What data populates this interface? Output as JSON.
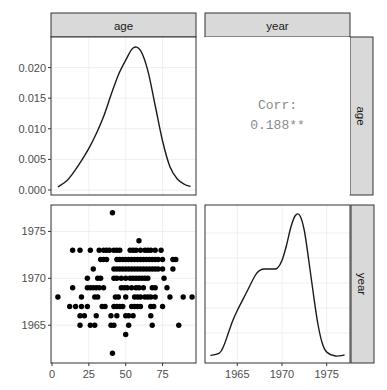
{
  "chart_data": {
    "type": "pairs",
    "title": "",
    "variables": [
      "age",
      "year"
    ],
    "panels": {
      "age_density": {
        "type": "line",
        "xlabel": "age",
        "ylabel": "density",
        "xlim": [
          0,
          97
        ],
        "ylim": [
          0,
          0.0245
        ],
        "y_ticks": [
          0.0,
          0.005,
          0.01,
          0.015,
          0.02
        ],
        "y_tick_labels": [
          "0.000",
          "0.005",
          "0.010",
          "0.015",
          "0.020"
        ],
        "x": [
          4,
          10,
          15,
          20,
          25,
          30,
          35,
          40,
          45,
          50,
          55,
          60,
          65,
          70,
          75,
          80,
          85,
          90,
          94
        ],
        "y": [
          0.0005,
          0.0015,
          0.003,
          0.0048,
          0.0068,
          0.0092,
          0.012,
          0.0155,
          0.0188,
          0.0212,
          0.0232,
          0.0228,
          0.0195,
          0.0138,
          0.008,
          0.0038,
          0.0018,
          0.0009,
          0.0006
        ]
      },
      "correlation": {
        "type": "text",
        "label": "Corr:",
        "value": "0.188**"
      },
      "scatter": {
        "type": "scatter",
        "xlabel": "age",
        "ylabel": "year",
        "xlim": [
          0,
          97
        ],
        "ylim": [
          1961.5,
          1977.5
        ],
        "x_ticks": [
          0,
          25,
          50,
          75
        ],
        "x_tick_labels": [
          "0",
          "25",
          "50",
          "75"
        ],
        "y_ticks": [
          1965,
          1970,
          1975
        ],
        "y_tick_labels": [
          "1965",
          "1970",
          "1975"
        ],
        "points": [
          [
            41,
            1977
          ],
          [
            59,
            1974
          ],
          [
            14,
            1973
          ],
          [
            19,
            1973
          ],
          [
            26,
            1973
          ],
          [
            32,
            1973
          ],
          [
            35,
            1973
          ],
          [
            37,
            1973
          ],
          [
            39,
            1973
          ],
          [
            42,
            1973
          ],
          [
            44,
            1973
          ],
          [
            46,
            1973
          ],
          [
            53,
            1973
          ],
          [
            55,
            1973
          ],
          [
            57,
            1973
          ],
          [
            60,
            1973
          ],
          [
            63,
            1973
          ],
          [
            65,
            1973
          ],
          [
            67,
            1973
          ],
          [
            70,
            1973
          ],
          [
            74,
            1973
          ],
          [
            33,
            1972
          ],
          [
            35,
            1972
          ],
          [
            37,
            1972
          ],
          [
            44,
            1972
          ],
          [
            46,
            1972
          ],
          [
            48,
            1972
          ],
          [
            50,
            1972
          ],
          [
            52,
            1972
          ],
          [
            54,
            1972
          ],
          [
            56,
            1972
          ],
          [
            58,
            1972
          ],
          [
            60,
            1972
          ],
          [
            62,
            1972
          ],
          [
            64,
            1972
          ],
          [
            66,
            1972
          ],
          [
            68,
            1972
          ],
          [
            70,
            1972
          ],
          [
            72,
            1972
          ],
          [
            75,
            1972
          ],
          [
            82,
            1972
          ],
          [
            84,
            1972
          ],
          [
            28,
            1971
          ],
          [
            42,
            1971
          ],
          [
            44,
            1971
          ],
          [
            46,
            1971
          ],
          [
            48,
            1971
          ],
          [
            50,
            1971
          ],
          [
            52,
            1971
          ],
          [
            54,
            1971
          ],
          [
            56,
            1971
          ],
          [
            58,
            1971
          ],
          [
            60,
            1971
          ],
          [
            62,
            1971
          ],
          [
            64,
            1971
          ],
          [
            66,
            1971
          ],
          [
            68,
            1971
          ],
          [
            70,
            1971
          ],
          [
            72,
            1971
          ],
          [
            75,
            1971
          ],
          [
            82,
            1971
          ],
          [
            24,
            1970
          ],
          [
            31,
            1970
          ],
          [
            33,
            1970
          ],
          [
            42,
            1970
          ],
          [
            44,
            1970
          ],
          [
            47,
            1970
          ],
          [
            50,
            1970
          ],
          [
            53,
            1970
          ],
          [
            55,
            1970
          ],
          [
            57,
            1970
          ],
          [
            59,
            1970
          ],
          [
            61,
            1970
          ],
          [
            63,
            1970
          ],
          [
            65,
            1970
          ],
          [
            76,
            1970
          ],
          [
            14,
            1969
          ],
          [
            24,
            1969
          ],
          [
            26,
            1969
          ],
          [
            28,
            1969
          ],
          [
            30,
            1969
          ],
          [
            32,
            1969
          ],
          [
            35,
            1969
          ],
          [
            47,
            1969
          ],
          [
            49,
            1969
          ],
          [
            51,
            1969
          ],
          [
            54,
            1969
          ],
          [
            57,
            1969
          ],
          [
            59,
            1969
          ],
          [
            62,
            1969
          ],
          [
            68,
            1969
          ],
          [
            70,
            1969
          ],
          [
            78,
            1969
          ],
          [
            4,
            1968
          ],
          [
            20,
            1968
          ],
          [
            29,
            1968
          ],
          [
            31,
            1968
          ],
          [
            43,
            1968
          ],
          [
            45,
            1968
          ],
          [
            50,
            1968
          ],
          [
            56,
            1968
          ],
          [
            58,
            1968
          ],
          [
            60,
            1968
          ],
          [
            63,
            1968
          ],
          [
            65,
            1968
          ],
          [
            67,
            1968
          ],
          [
            70,
            1968
          ],
          [
            80,
            1968
          ],
          [
            89,
            1968
          ],
          [
            95,
            1968
          ],
          [
            12,
            1967
          ],
          [
            16,
            1967
          ],
          [
            20,
            1967
          ],
          [
            24,
            1967
          ],
          [
            34,
            1967
          ],
          [
            36,
            1967
          ],
          [
            42,
            1967
          ],
          [
            44,
            1967
          ],
          [
            46,
            1967
          ],
          [
            48,
            1967
          ],
          [
            54,
            1967
          ],
          [
            56,
            1967
          ],
          [
            58,
            1967
          ],
          [
            60,
            1967
          ],
          [
            67,
            1967
          ],
          [
            69,
            1967
          ],
          [
            75,
            1967
          ],
          [
            19,
            1966
          ],
          [
            22,
            1966
          ],
          [
            30,
            1966
          ],
          [
            40,
            1966
          ],
          [
            44,
            1966
          ],
          [
            50,
            1966
          ],
          [
            52,
            1966
          ],
          [
            55,
            1966
          ],
          [
            67,
            1966
          ],
          [
            19,
            1965
          ],
          [
            26,
            1965
          ],
          [
            29,
            1965
          ],
          [
            40,
            1965
          ],
          [
            42,
            1965
          ],
          [
            52,
            1965
          ],
          [
            68,
            1965
          ],
          [
            86,
            1965
          ],
          [
            50,
            1964
          ],
          [
            41,
            1962
          ]
        ]
      },
      "year_density": {
        "type": "line",
        "xlabel": "year",
        "ylabel": "density",
        "xlim": [
          1961.5,
          1977.5
        ],
        "x_ticks": [
          1965,
          1970,
          1975
        ],
        "x_tick_labels": [
          "1965",
          "1970",
          "1975"
        ],
        "x": [
          1962,
          1963,
          1963.5,
          1964,
          1964.5,
          1965,
          1966,
          1967,
          1967.5,
          1968,
          1969,
          1969.5,
          1970,
          1970.5,
          1971,
          1971.5,
          1972,
          1972.5,
          1973,
          1973.5,
          1974,
          1974.5,
          1975,
          1976,
          1977
        ],
        "y": [
          0.005,
          0.01,
          0.025,
          0.05,
          0.075,
          0.095,
          0.13,
          0.165,
          0.175,
          0.178,
          0.178,
          0.18,
          0.195,
          0.225,
          0.262,
          0.285,
          0.285,
          0.255,
          0.195,
          0.13,
          0.07,
          0.03,
          0.012,
          0.004,
          0.006
        ],
        "ylim": [
          0,
          0.3
        ]
      }
    },
    "strips": {
      "top": [
        "age",
        "year"
      ],
      "right": [
        "age",
        "year"
      ]
    }
  },
  "labels": {
    "strip_top_age": "age",
    "strip_top_year": "year",
    "strip_right_age": "age",
    "strip_right_year": "year",
    "corr_label": "Corr:",
    "corr_value": "0.188**"
  },
  "colors": {
    "strip_fill": "#d9d9d9",
    "strip_border": "#333333",
    "panel_border": "#333333",
    "grid": "#ebebeb",
    "line": "#1a1a1a",
    "point": "#000000",
    "corr_text": "#8a8a8a"
  }
}
